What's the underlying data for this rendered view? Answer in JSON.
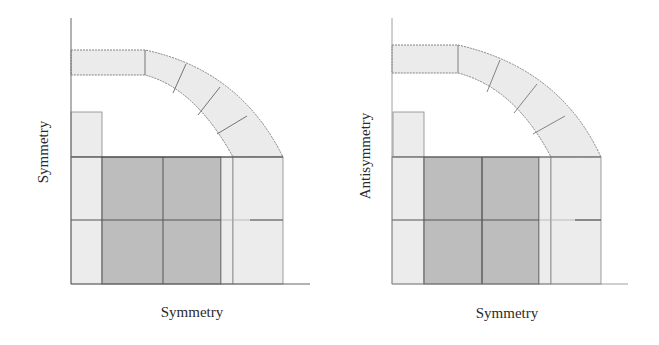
{
  "colors": {
    "light_fill": "#ececec",
    "dark_fill": "#bdbdbd",
    "arc_fill": "#ebebeb",
    "stroke": "#555555",
    "axis": "#666666",
    "text": "#2a2a2a"
  },
  "panels": [
    {
      "id": "left",
      "x_axis_label": "Symmetry",
      "y_axis_label": "Symmetry"
    },
    {
      "id": "right",
      "x_axis_label": "Symmetry",
      "y_axis_label": "Antisymmetry"
    }
  ]
}
